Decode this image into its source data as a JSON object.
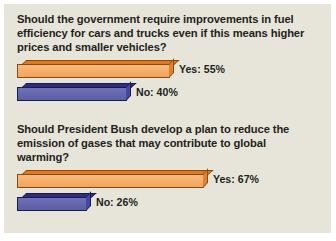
{
  "panel": {
    "background_color": "#e7e5da"
  },
  "colors": {
    "yes_bar": "#f7b06c",
    "yes_bar_outline": "#8a4a10",
    "no_bar": "#6568ae",
    "no_bar_outline": "#1a1a4d",
    "text": "#231f1c"
  },
  "chart_data": {
    "type": "bar",
    "orientation": "horizontal",
    "title": "",
    "xlabel": "",
    "ylabel": "",
    "xlim": [
      0,
      100
    ],
    "grid": false,
    "legend": "none",
    "charts": [
      {
        "title": "Should the government require improvements in fuel efficiency for cars and trucks even if this means higher prices and smaller vehicles?",
        "categories": [
          "Yes",
          "No"
        ],
        "values": [
          55,
          40
        ],
        "labels": [
          "Yes: 55%",
          "No: 40%"
        ]
      },
      {
        "title": "Should President Bush develop a plan to reduce the emission of gases that may contribute to global warming?",
        "categories": [
          "Yes",
          "No"
        ],
        "values": [
          67,
          26
        ],
        "labels": [
          "Yes: 67%",
          "No: 26%"
        ]
      }
    ]
  }
}
